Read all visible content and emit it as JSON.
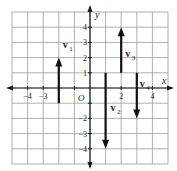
{
  "diagram": {
    "x_axis_label": "x",
    "y_axis_label": "y",
    "origin_label": "O",
    "x_range": [
      -5,
      5
    ],
    "y_range": [
      -5,
      5
    ],
    "x_tick_labels": [
      {
        "value": -4,
        "text": "−4"
      },
      {
        "value": -3,
        "text": "−3"
      },
      {
        "value": 2,
        "text": "2"
      },
      {
        "value": 4,
        "text": "4"
      }
    ],
    "y_tick_labels": [
      {
        "value": 4,
        "text": "4"
      },
      {
        "value": 3,
        "text": "3"
      },
      {
        "value": 2,
        "text": "2"
      },
      {
        "value": 1,
        "text": "1"
      },
      {
        "value": -2,
        "text": "−2"
      },
      {
        "value": -3,
        "text": "−3"
      },
      {
        "value": -4,
        "text": "−4"
      }
    ],
    "vectors": [
      {
        "name": "v1",
        "label": "v",
        "subscript": "1",
        "x": -2,
        "y_start": -1,
        "y_end": 2
      },
      {
        "name": "v2",
        "label": "v",
        "subscript": "2",
        "x": 1,
        "y_start": 1,
        "y_end": -4
      },
      {
        "name": "v3",
        "label": "v",
        "subscript": "3",
        "x": 2,
        "y_start": 1,
        "y_end": 4
      },
      {
        "name": "v4",
        "label": "v",
        "subscript": "4",
        "x": 3,
        "y_start": 1,
        "y_end": -2
      }
    ],
    "colors": {
      "grid": "#9a9a9a",
      "axis": "#1a1a1a",
      "vector": "#111111",
      "background": "#ffffff"
    }
  }
}
